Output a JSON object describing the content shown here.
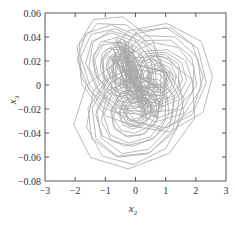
{
  "chart_data": {
    "type": "line",
    "title": "",
    "xlabel": "x",
    "xlabel_subscript": "2",
    "ylabel": "x",
    "ylabel_subscript": "3",
    "xlim": [
      -3,
      3
    ],
    "ylim": [
      -0.08,
      0.06
    ],
    "xticks": [
      -3,
      -2,
      -1,
      0,
      1,
      2,
      3
    ],
    "xtick_labels": [
      "−3",
      "−2",
      "−1",
      "0",
      "1",
      "2",
      "3"
    ],
    "yticks": [
      0.06,
      0.04,
      0.02,
      0,
      -0.02,
      -0.04,
      -0.06,
      -0.08
    ],
    "ytick_labels": [
      "0.06",
      "0.04",
      "0.02",
      "0",
      "−0.02",
      "−0.04",
      "−0.06",
      "−0.08"
    ],
    "grid": false,
    "legend": null,
    "line_color": "#a8a8a8",
    "lobes": [
      {
        "name": "upper-left",
        "cx": -0.45,
        "cy": 0.012,
        "rx_min": 0.3,
        "rx_max": 1.55,
        "ry_min": 0.008,
        "ry_max": 0.043,
        "tilt": -0.012,
        "loops": 18
      },
      {
        "name": "right",
        "cx": 0.75,
        "cy": 0.006,
        "rx_min": 0.25,
        "rx_max": 1.75,
        "ry_min": 0.006,
        "ry_max": 0.045,
        "tilt": 0.0,
        "loops": 16
      },
      {
        "name": "lower",
        "cx": 0.0,
        "cy": -0.022,
        "rx_min": 0.3,
        "rx_max": 1.95,
        "ry_min": 0.008,
        "ry_max": 0.047,
        "tilt": 0.008,
        "loops": 16
      }
    ],
    "extent": {
      "x_min": -2.05,
      "x_max": 2.55,
      "y_min": -0.07,
      "y_max": 0.057
    }
  }
}
